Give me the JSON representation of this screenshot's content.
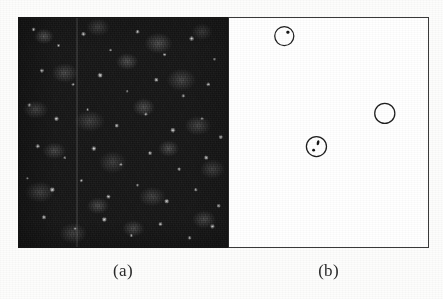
{
  "figure": {
    "background_color": "#fdfdfc",
    "panel_count": 2
  },
  "panels": [
    {
      "id": "panel-a",
      "caption": "(a)",
      "kind": "speckle-image",
      "description": "dark grainy speckle texture image",
      "background_color": "#1d1d1d",
      "border_color": "#151515",
      "annotation_count": 0
    },
    {
      "id": "panel-b",
      "caption": "(b)",
      "kind": "annotation-panel",
      "description": "white panel with circular detection markers",
      "background_color": "#ffffff",
      "border_color": "#3a3a3a",
      "annotation_count": 3
    }
  ],
  "annotations": {
    "stroke_color": "#1f1f1f",
    "fill_color": "#ffffff",
    "mark_color": "#161616",
    "circles": [
      {
        "id": "marker-1",
        "label": "top-left-marker",
        "cx": 55,
        "cy": 18,
        "r": 9.5,
        "marks": [
          {
            "cx": 58.6,
            "cy": 14.2,
            "rx": 1.7,
            "ry": 1.5,
            "rot": -20
          }
        ]
      },
      {
        "id": "marker-2",
        "label": "center-marker",
        "cx": 87,
        "cy": 128,
        "r": 10,
        "marks": [
          {
            "cx": 88.6,
            "cy": 124.2,
            "rx": 1.3,
            "ry": 2.6,
            "rot": 12
          },
          {
            "cx": 84.2,
            "cy": 131.6,
            "rx": 1.4,
            "ry": 1.3,
            "rot": 0
          }
        ]
      },
      {
        "id": "marker-3",
        "label": "right-marker",
        "cx": 155,
        "cy": 95,
        "r": 10,
        "marks": []
      }
    ]
  },
  "captions": {
    "a": "(a)",
    "b": "(b)"
  }
}
